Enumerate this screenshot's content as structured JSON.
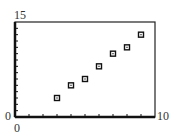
{
  "chart_data": {
    "type": "scatter",
    "title": "",
    "xlabel": "",
    "ylabel": "",
    "xlim": [
      0,
      10
    ],
    "ylim": [
      0,
      15
    ],
    "x_tick_count": 10,
    "y_tick_count": 15,
    "grid": false,
    "marker": "square",
    "points": [
      {
        "x": 3,
        "y": 3
      },
      {
        "x": 4,
        "y": 5
      },
      {
        "x": 5,
        "y": 6
      },
      {
        "x": 6,
        "y": 8
      },
      {
        "x": 7,
        "y": 10
      },
      {
        "x": 8,
        "y": 11
      },
      {
        "x": 9,
        "y": 13
      }
    ],
    "labels": {
      "ymax": "15",
      "ymin": "0",
      "xmin": "0",
      "xmax": "10"
    }
  }
}
